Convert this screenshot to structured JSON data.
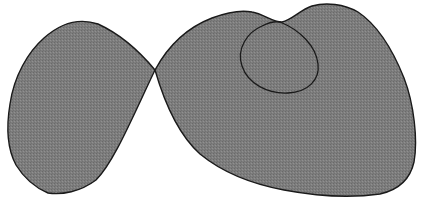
{
  "figure": {
    "colors": {
      "background": "#ffffff",
      "fill": "#7d7d7d",
      "stroke": "#1a1a1a"
    },
    "regions": [
      {
        "name": "left-lobe"
      },
      {
        "name": "right-lobe"
      },
      {
        "name": "inner-loop"
      }
    ],
    "crossing_point": {
      "x": 155,
      "y": 70
    }
  }
}
